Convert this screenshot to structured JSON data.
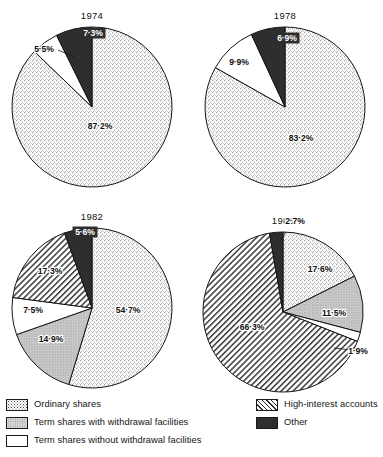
{
  "figure": {
    "title": "",
    "layout": "2x2 grid of pie charts with shared legend below"
  },
  "chart_data": [
    {
      "type": "pie",
      "title": "1974",
      "center": {
        "x": 92,
        "y": 107
      },
      "radius": 80,
      "categories": [
        "Ordinary shares",
        "Term shares without withdrawal facilities",
        "Other"
      ],
      "values": [
        87.2,
        5.5,
        7.3
      ],
      "labels": [
        "87·2%",
        "5·5%",
        "7·3%"
      ],
      "patterns": [
        "stipple",
        "white",
        "black"
      ],
      "label_positions": [
        {
          "x": 100,
          "y": 129,
          "dark_bg": false
        },
        {
          "x": 44,
          "y": 52,
          "dark_bg": false
        },
        {
          "x": 93,
          "y": 36,
          "dark_bg": true
        }
      ],
      "leaders": [
        null,
        [
          [
            58,
            50
          ],
          [
            74,
            57
          ]
        ],
        null
      ]
    },
    {
      "type": "pie",
      "title": "1978",
      "center": {
        "x": 285,
        "y": 107
      },
      "radius": 80,
      "categories": [
        "Ordinary shares",
        "Term shares without withdrawal facilities",
        "Other"
      ],
      "values": [
        83.2,
        9.9,
        6.9
      ],
      "labels": [
        "83·2%",
        "9·9%",
        "6·9%"
      ],
      "patterns": [
        "stipple",
        "white",
        "black"
      ],
      "label_positions": [
        {
          "x": 301,
          "y": 141,
          "dark_bg": false
        },
        {
          "x": 239,
          "y": 65,
          "dark_bg": false
        },
        {
          "x": 287,
          "y": 41,
          "dark_bg": true
        }
      ],
      "leaders": [
        null,
        null,
        null
      ]
    },
    {
      "type": "pie",
      "title": "1982",
      "center": {
        "x": 92,
        "y": 308
      },
      "radius": 80,
      "categories": [
        "Ordinary shares",
        "Term shares with withdrawal facilities",
        "Term shares without withdrawal facilities",
        "High-interest accounts",
        "Other"
      ],
      "values": [
        54.7,
        14.9,
        7.5,
        17.3,
        5.6
      ],
      "labels": [
        "54·7%",
        "14·9%",
        "7·5%",
        "17·3%",
        "5·6%"
      ],
      "patterns": [
        "stipple",
        "greydot",
        "white",
        "hatch",
        "black"
      ],
      "label_positions": [
        {
          "x": 128,
          "y": 313,
          "dark_bg": false
        },
        {
          "x": 51,
          "y": 342,
          "dark_bg": false
        },
        {
          "x": 33,
          "y": 313,
          "dark_bg": false
        },
        {
          "x": 50,
          "y": 274,
          "dark_bg": false
        },
        {
          "x": 85,
          "y": 235,
          "dark_bg": true
        }
      ],
      "leaders": [
        null,
        null,
        null,
        null,
        null
      ]
    },
    {
      "type": "pie",
      "title": "1986",
      "center": {
        "x": 283,
        "y": 312
      },
      "radius": 80,
      "categories": [
        "Ordinary shares",
        "Term shares with withdrawal facilities",
        "Term shares without withdrawal facilities",
        "High-interest accounts",
        "Other"
      ],
      "values": [
        17.6,
        11.5,
        1.9,
        66.3,
        2.7
      ],
      "labels": [
        "17·6%",
        "11·5%",
        "1·9%",
        "66·3%",
        "2·7%"
      ],
      "patterns": [
        "stipple",
        "greydot",
        "white",
        "hatch",
        "black"
      ],
      "label_positions": [
        {
          "x": 320,
          "y": 272,
          "dark_bg": false
        },
        {
          "x": 334,
          "y": 316,
          "dark_bg": false
        },
        {
          "x": 358,
          "y": 354,
          "dark_bg": false
        },
        {
          "x": 252,
          "y": 330,
          "dark_bg": false
        },
        {
          "x": 295,
          "y": 224,
          "dark_bg": false
        }
      ],
      "leaders": [
        null,
        null,
        [
          [
            334,
            348
          ],
          [
            351,
            350
          ]
        ],
        null,
        [
          [
            286,
            232
          ],
          [
            281,
            240
          ]
        ]
      ]
    }
  ],
  "legend": {
    "left_items": [
      {
        "label": "Ordinary shares",
        "pattern": "stipple"
      },
      {
        "label": "Term shares with withdrawal facilities",
        "pattern": "greydot"
      },
      {
        "label": "Term  shares without withdrawal facilities",
        "pattern": "white"
      }
    ],
    "right_items": [
      {
        "label": "High-interest accounts",
        "pattern": "hatch"
      },
      {
        "label": "Other",
        "pattern": "black"
      }
    ]
  },
  "colors": {
    "stipple": "#f2f2f2",
    "greydot": "#cfcfcf",
    "white": "#ffffff",
    "hatch": "#dedede",
    "black": "#2e2e2e",
    "outline": "#151515",
    "text": "#111111"
  }
}
